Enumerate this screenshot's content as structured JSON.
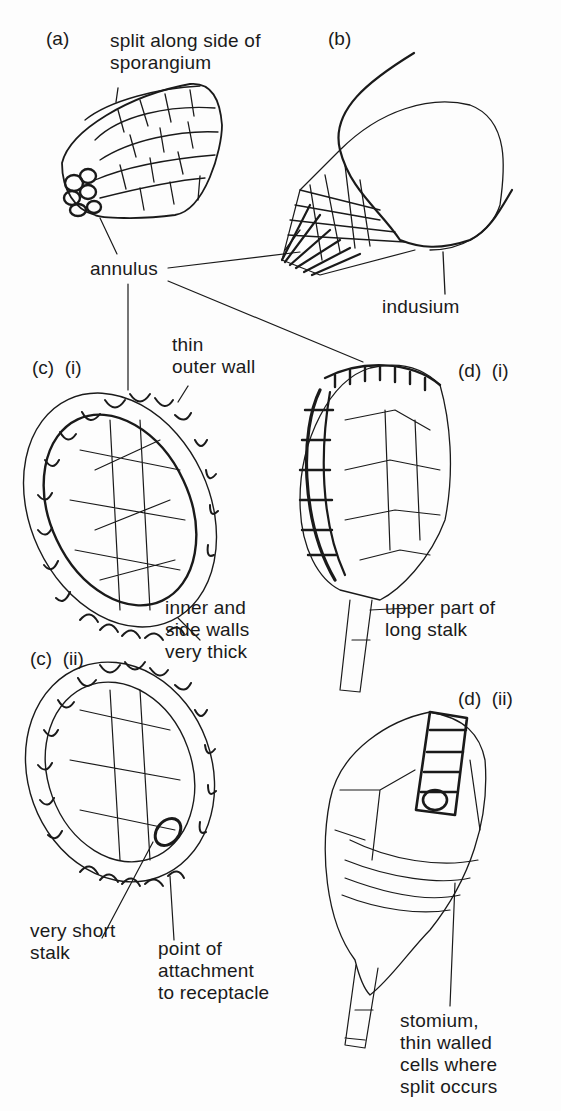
{
  "figure": {
    "panels": {
      "a": {
        "tag": "(a)"
      },
      "b": {
        "tag": "(b)"
      },
      "c_i": {
        "tag": "(c)  (i)"
      },
      "c_ii": {
        "tag": "(c)  (ii)"
      },
      "d_i": {
        "tag": "(d)  (i)"
      },
      "d_ii": {
        "tag": "(d)  (ii)"
      }
    },
    "labels": {
      "split_side": "split along side of\nsporangium",
      "annulus": "annulus",
      "indusium": "indusium",
      "thin_outer_wall": "thin\nouter wall",
      "inner_side_walls": "inner and\nside walls\nvery thick",
      "upper_stalk": "upper part of\nlong stalk",
      "very_short_stalk": "very short\nstalk",
      "point_attachment": "point of\nattachment\nto receptacle",
      "stomium": "stomium,\nthin walled\ncells where\nsplit occurs"
    },
    "colors": {
      "ink": "#1a1a1a",
      "paper": "#fdfdfd"
    }
  }
}
